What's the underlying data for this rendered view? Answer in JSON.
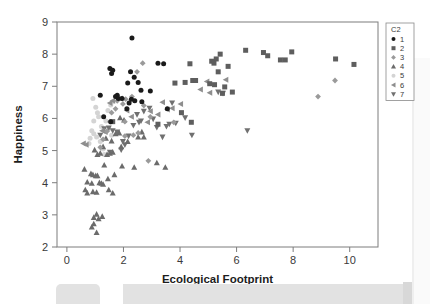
{
  "chart_data": {
    "type": "scatter",
    "title": "",
    "xlabel": "Ecological Footprint",
    "ylabel": "Happiness",
    "xlim": [
      -0.35,
      11.0
    ],
    "ylim": [
      2,
      9
    ],
    "xticks": [
      0,
      2,
      4,
      6,
      8,
      10
    ],
    "yticks": [
      2,
      3,
      4,
      5,
      6,
      7,
      8,
      9
    ],
    "grid": false,
    "legend": {
      "title": "C2",
      "position": "right-outside",
      "entries": [
        {
          "label": "1",
          "marker": "circle",
          "color": "#1a1a1a"
        },
        {
          "label": "2",
          "marker": "square",
          "color": "#5e5e5e"
        },
        {
          "label": "3",
          "marker": "diamond",
          "color": "#9a9a9a"
        },
        {
          "label": "4",
          "marker": "triangle-up",
          "color": "#6b6b6b"
        },
        {
          "label": "5",
          "marker": "circle-open",
          "color": "#d4d4d4"
        },
        {
          "label": "6",
          "marker": "triangle-left",
          "color": "#8e8e8e"
        },
        {
          "label": "7",
          "marker": "triangle-down",
          "color": "#707070"
        }
      ]
    },
    "series": [
      {
        "name": "1",
        "marker": "circle",
        "color": "#1a1a1a",
        "points": [
          [
            2.3,
            8.5
          ],
          [
            1.52,
            7.55
          ],
          [
            1.62,
            7.5
          ],
          [
            1.58,
            7.4
          ],
          [
            2.25,
            7.45
          ],
          [
            3.22,
            7.72
          ],
          [
            3.42,
            7.7
          ],
          [
            2.38,
            7.28
          ],
          [
            2.15,
            7.1
          ],
          [
            2.52,
            7.12
          ],
          [
            1.78,
            6.72
          ],
          [
            1.72,
            6.68
          ],
          [
            2.62,
            6.88
          ],
          [
            2.95,
            6.85
          ],
          [
            1.18,
            6.72
          ],
          [
            2.28,
            6.6
          ],
          [
            2.4,
            6.55
          ],
          [
            2.65,
            6.52
          ],
          [
            2.2,
            6.48
          ],
          [
            1.55,
            5.9
          ],
          [
            1.82,
            6.62
          ],
          [
            1.95,
            6.62
          ],
          [
            3.55,
            6.3
          ],
          [
            1.3,
            6.05
          ],
          [
            2.12,
            6.3
          ]
        ]
      },
      {
        "name": "2",
        "marker": "square",
        "color": "#5e5e5e",
        "points": [
          [
            5.42,
            8.0
          ],
          [
            6.32,
            8.12
          ],
          [
            6.95,
            8.05
          ],
          [
            7.1,
            7.95
          ],
          [
            7.95,
            8.07
          ],
          [
            7.55,
            7.82
          ],
          [
            7.72,
            7.82
          ],
          [
            5.28,
            7.85
          ],
          [
            5.12,
            7.78
          ],
          [
            5.2,
            7.72
          ],
          [
            5.35,
            7.45
          ],
          [
            4.35,
            7.7
          ],
          [
            5.7,
            7.62
          ],
          [
            9.5,
            7.85
          ],
          [
            10.15,
            7.68
          ],
          [
            4.45,
            7.18
          ],
          [
            4.55,
            7.18
          ],
          [
            3.82,
            7.1
          ],
          [
            4.18,
            7.12
          ],
          [
            5.05,
            7.08
          ],
          [
            5.22,
            7.05
          ],
          [
            5.58,
            6.98
          ],
          [
            5.5,
            6.78
          ],
          [
            5.85,
            6.82
          ],
          [
            4.4,
            5.88
          ],
          [
            1.62,
            5.9
          ],
          [
            3.22,
            5.82
          ],
          [
            4.05,
            6.18
          ]
        ]
      },
      {
        "name": "3",
        "marker": "diamond",
        "color": "#9a9a9a",
        "points": [
          [
            2.68,
            7.72
          ],
          [
            2.48,
            7.45
          ],
          [
            8.88,
            6.68
          ],
          [
            9.48,
            7.18
          ],
          [
            2.3,
            6.68
          ],
          [
            2.08,
            6.6
          ],
          [
            1.98,
            6.45
          ],
          [
            2.72,
            6.4
          ],
          [
            1.72,
            6.3
          ],
          [
            1.58,
            6.18
          ],
          [
            2.05,
            5.9
          ],
          [
            1.52,
            5.9
          ],
          [
            2.52,
            5.55
          ],
          [
            2.35,
            5.48
          ],
          [
            1.42,
            5.6
          ],
          [
            1.28,
            5.35
          ],
          [
            1.18,
            5.1
          ],
          [
            2.88,
            4.68
          ],
          [
            2.05,
            5.45
          ],
          [
            1.78,
            6.55
          ],
          [
            3.78,
            5.88
          ],
          [
            2.95,
            6.05
          ]
        ]
      },
      {
        "name": "4",
        "marker": "triangle-up",
        "color": "#6b6b6b",
        "points": [
          [
            0.62,
            4.42
          ],
          [
            0.85,
            4.28
          ],
          [
            0.92,
            4.25
          ],
          [
            1.02,
            4.22
          ],
          [
            1.08,
            4.22
          ],
          [
            0.72,
            4.02
          ],
          [
            0.88,
            3.98
          ],
          [
            1.15,
            4.0
          ],
          [
            1.22,
            3.98
          ],
          [
            1.28,
            3.95
          ],
          [
            0.65,
            3.78
          ],
          [
            0.72,
            3.68
          ],
          [
            0.92,
            3.72
          ],
          [
            1.05,
            3.7
          ],
          [
            1.48,
            3.78
          ],
          [
            1.62,
            3.68
          ],
          [
            0.95,
            2.92
          ],
          [
            1.05,
            3.02
          ],
          [
            1.12,
            2.88
          ],
          [
            1.25,
            2.95
          ],
          [
            0.88,
            2.62
          ],
          [
            0.95,
            2.72
          ],
          [
            1.05,
            2.45
          ],
          [
            1.18,
            4.92
          ],
          [
            1.42,
            4.88
          ],
          [
            1.52,
            4.92
          ],
          [
            1.62,
            4.95
          ],
          [
            1.28,
            5.12
          ],
          [
            1.38,
            5.38
          ],
          [
            1.58,
            5.3
          ],
          [
            1.72,
            5.52
          ],
          [
            1.85,
            5.55
          ],
          [
            2.15,
            5.28
          ],
          [
            2.38,
            4.48
          ],
          [
            3.48,
            4.48
          ],
          [
            3.18,
            4.62
          ],
          [
            1.95,
            4.52
          ],
          [
            1.32,
            4.55
          ],
          [
            1.08,
            4.88
          ],
          [
            2.52,
            5.42
          ],
          [
            1.68,
            4.25
          ],
          [
            0.98,
            5.02
          ],
          [
            2.02,
            5.95
          ],
          [
            1.88,
            6.02
          ],
          [
            1.45,
            4.12
          ],
          [
            2.65,
            5.58
          ],
          [
            2.72,
            5.42
          ],
          [
            1.92,
            5.12
          ]
        ]
      },
      {
        "name": "5",
        "marker": "circle-open",
        "color": "#d4d4d4",
        "points": [
          [
            1.02,
            6.35
          ],
          [
            1.08,
            6.18
          ],
          [
            1.12,
            6.05
          ],
          [
            0.95,
            5.92
          ],
          [
            1.22,
            5.75
          ],
          [
            0.88,
            5.62
          ],
          [
            0.95,
            5.52
          ],
          [
            1.05,
            5.42
          ],
          [
            0.82,
            5.38
          ],
          [
            1.18,
            5.28
          ],
          [
            0.78,
            5.22
          ],
          [
            1.28,
            5.05
          ],
          [
            1.32,
            4.88
          ],
          [
            1.45,
            6.25
          ],
          [
            1.55,
            6.42
          ],
          [
            1.62,
            6.52
          ],
          [
            0.92,
            6.62
          ],
          [
            1.38,
            5.92
          ],
          [
            1.48,
            5.68
          ],
          [
            1.58,
            5.48
          ]
        ]
      },
      {
        "name": "6",
        "marker": "triangle-left",
        "color": "#8e8e8e",
        "points": [
          [
            5.62,
            7.2
          ],
          [
            5.05,
            6.8
          ],
          [
            4.02,
            6.45
          ],
          [
            3.72,
            6.32
          ],
          [
            3.55,
            6.28
          ],
          [
            2.95,
            6.22
          ],
          [
            3.22,
            6.12
          ],
          [
            4.72,
            6.9
          ],
          [
            0.58,
            5.22
          ],
          [
            0.68,
            5.18
          ],
          [
            1.25,
            5.62
          ],
          [
            1.35,
            5.58
          ],
          [
            1.52,
            6.48
          ],
          [
            1.62,
            6.55
          ],
          [
            1.88,
            6.62
          ],
          [
            2.12,
            6.25
          ],
          [
            2.85,
            5.88
          ],
          [
            3.38,
            6.5
          ],
          [
            4.95,
            7.15
          ],
          [
            2.28,
            6.05
          ]
        ]
      },
      {
        "name": "7",
        "marker": "triangle-down",
        "color": "#707070",
        "points": [
          [
            6.38,
            5.62
          ],
          [
            4.42,
            5.48
          ],
          [
            5.35,
            6.82
          ],
          [
            5.52,
            6.78
          ],
          [
            3.72,
            6.48
          ],
          [
            3.38,
            5.42
          ],
          [
            3.52,
            5.75
          ],
          [
            3.18,
            5.72
          ],
          [
            2.92,
            6.32
          ],
          [
            2.72,
            6.22
          ],
          [
            2.55,
            5.88
          ],
          [
            2.35,
            5.78
          ],
          [
            2.18,
            5.45
          ],
          [
            1.98,
            5.28
          ],
          [
            1.78,
            5.58
          ],
          [
            1.62,
            5.62
          ],
          [
            1.48,
            5.7
          ],
          [
            1.32,
            5.68
          ],
          [
            1.18,
            5.48
          ],
          [
            2.05,
            5.18
          ],
          [
            2.62,
            5.92
          ],
          [
            3.05,
            5.98
          ],
          [
            3.62,
            5.82
          ],
          [
            4.18,
            6.02
          ],
          [
            1.92,
            5.02
          ],
          [
            1.52,
            4.95
          ],
          [
            2.48,
            6.12
          ],
          [
            3.85,
            5.85
          ]
        ]
      }
    ]
  }
}
